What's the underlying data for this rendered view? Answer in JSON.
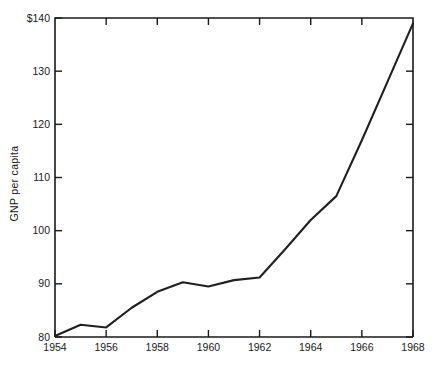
{
  "chart_data": {
    "type": "line",
    "title": "",
    "xlabel": "",
    "ylabel": "GNP per capita",
    "x": [
      1954,
      1955,
      1956,
      1957,
      1958,
      1959,
      1960,
      1961,
      1962,
      1963,
      1964,
      1965,
      1966,
      1967,
      1968
    ],
    "values": [
      80.2,
      82.3,
      81.8,
      85.5,
      88.5,
      90.3,
      89.5,
      90.7,
      91.2,
      96.5,
      102.0,
      106.5,
      117.0,
      128.0,
      139.0
    ],
    "series": [
      {
        "name": "GNP per capita",
        "values": [
          80.2,
          82.3,
          81.8,
          85.5,
          88.5,
          90.3,
          89.5,
          90.7,
          91.2,
          96.5,
          102.0,
          106.5,
          117.0,
          128.0,
          139.0
        ]
      }
    ],
    "xlim": [
      1954,
      1968
    ],
    "ylim": [
      80,
      140
    ],
    "grid": false,
    "legend": false,
    "x_tick_values": [
      1954,
      1956,
      1958,
      1960,
      1962,
      1964,
      1966,
      1968
    ],
    "x_tick_labels": [
      "1954",
      "1956",
      "1958",
      "1960",
      "1962",
      "1964",
      "1966",
      "1968"
    ],
    "y_tick_values": [
      80,
      90,
      100,
      110,
      120,
      130,
      140
    ],
    "y_tick_labels": [
      "80",
      "90",
      "100",
      "110",
      "120",
      "130",
      "140"
    ],
    "y_top_label": "$140",
    "line_color": "#1f1f1f",
    "axis_color": "#1a1a1a",
    "background_color": "#ffffff"
  }
}
